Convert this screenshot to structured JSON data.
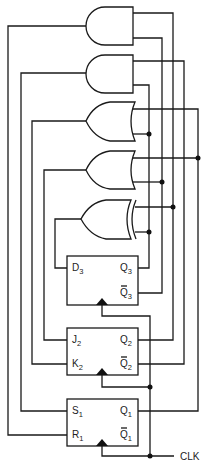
{
  "diagram": {
    "type": "sequential logic circuit",
    "gates": [
      {
        "id": "and1",
        "kind": "AND",
        "output_to": "R1"
      },
      {
        "id": "and2",
        "kind": "AND",
        "output_to": "S1"
      },
      {
        "id": "or1",
        "kind": "OR",
        "output_to": "K2"
      },
      {
        "id": "or2",
        "kind": "OR",
        "output_to": "J2"
      },
      {
        "id": "xor1",
        "kind": "XOR",
        "output_to": "D3"
      }
    ],
    "flip_flops": [
      {
        "id": "ff3",
        "type": "D",
        "inputs": [
          {
            "name": "D",
            "sub": "3"
          }
        ],
        "outputs": [
          {
            "name": "Q",
            "sub": "3",
            "bar": false
          },
          {
            "name": "Q",
            "sub": "3",
            "bar": true
          }
        ]
      },
      {
        "id": "ff2",
        "type": "JK",
        "inputs": [
          {
            "name": "J",
            "sub": "2"
          },
          {
            "name": "K",
            "sub": "2"
          }
        ],
        "outputs": [
          {
            "name": "Q",
            "sub": "2",
            "bar": false
          },
          {
            "name": "Q",
            "sub": "2",
            "bar": true
          }
        ]
      },
      {
        "id": "ff1",
        "type": "SR",
        "inputs": [
          {
            "name": "S",
            "sub": "1"
          },
          {
            "name": "R",
            "sub": "1"
          }
        ],
        "outputs": [
          {
            "name": "Q",
            "sub": "1",
            "bar": false
          },
          {
            "name": "Q",
            "sub": "1",
            "bar": true
          }
        ]
      }
    ],
    "clock_label": "CLK",
    "connections": [
      "Q3 -> AND2.in2, OR1.in2, XOR.in2",
      "Q3bar -> AND1.in2, OR2.in2",
      "Q2 -> AND1.in1, XOR.in1",
      "Q2bar -> AND2.in1",
      "Q1 -> OR1.in1, OR2.in1",
      "CLK -> FF3.clk, FF2.clk, FF1.clk"
    ]
  }
}
